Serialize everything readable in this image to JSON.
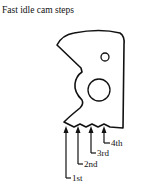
{
  "figure": {
    "title": "Fast idle cam steps",
    "part": "fast-idle-cam",
    "steps": [
      {
        "label": "1st"
      },
      {
        "label": "2nd"
      },
      {
        "label": "3rd"
      },
      {
        "label": "4th"
      }
    ],
    "colors": {
      "stroke": "#111111",
      "background": "#ffffff"
    }
  }
}
